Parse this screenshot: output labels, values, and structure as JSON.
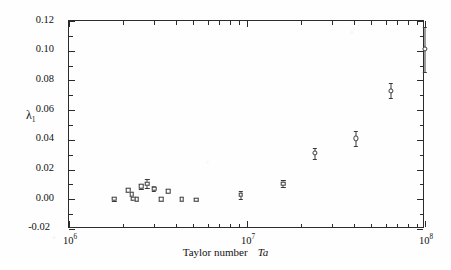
{
  "figure": {
    "background_color": "#fefefe",
    "axis_color": "#2b2b2b",
    "marker_color": "#3a3a3a"
  },
  "axes": {
    "y_title": "λ",
    "y_title_sub": "1",
    "x_title": "Taylor number",
    "x_title_symbol": "Ta",
    "y_tick_labels": [
      "0.12",
      "0.10",
      "0.08",
      "0.06",
      "0.04",
      "0.02",
      "0.00",
      "-0.02"
    ],
    "x_tick_labels": [
      "10",
      "10",
      "10"
    ],
    "x_tick_exponents": [
      "6",
      "7",
      "8"
    ]
  },
  "chart_data": {
    "type": "scatter",
    "title": "",
    "xlabel": "Taylor number Ta",
    "ylabel": "λ1",
    "xscale": "log",
    "yscale": "linear",
    "xlim": [
      1000000,
      100000000
    ],
    "ylim": [
      -0.02,
      0.12
    ],
    "ytick_values": [
      0.12,
      0.1,
      0.08,
      0.06,
      0.04,
      0.02,
      0.0,
      -0.02
    ],
    "xtick_values": [
      1000000,
      10000000,
      100000000
    ],
    "grid": false,
    "legend": null,
    "series": [
      {
        "name": "lambda_1",
        "marker": "open-square",
        "x": [
          1800000,
          2150000,
          2250000,
          2300000,
          2400000,
          2550000,
          2750000,
          3000000,
          3300000,
          3600000,
          4300000,
          5200000,
          9200000,
          16000000
        ],
        "y": [
          0.0003,
          0.0062,
          0.0035,
          0.0005,
          0.0002,
          0.0088,
          0.0105,
          0.0072,
          0.0002,
          0.0055,
          0.0001,
          -0.0002,
          0.003,
          0.0105
        ],
        "yerr": [
          0.0014,
          0.0016,
          0.0014,
          0.0012,
          0.0012,
          0.0018,
          0.003,
          0.0018,
          0.0012,
          0.0016,
          0.0012,
          0.0012,
          0.0026,
          0.0022
        ]
      },
      {
        "name": "lambda_1_high_Ta",
        "marker": "open-circle",
        "x": [
          24000000,
          41000000,
          64000000,
          100000000
        ],
        "y": [
          0.031,
          0.041,
          0.073,
          0.101
        ],
        "yerr": [
          0.0036,
          0.005,
          0.005,
          0.015
        ]
      }
    ]
  }
}
